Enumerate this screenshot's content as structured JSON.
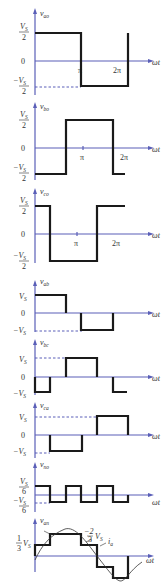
{
  "figure": {
    "axis_color": "#5a5fb8",
    "wave_color": "#1a1a1a",
    "x_label": "ωt",
    "x_ticks": [
      "π",
      "2π"
    ],
    "plots": [
      {
        "name": "v_ao",
        "label": "v",
        "sub": "ao",
        "y_ticks": {
          "top": "V_S/2",
          "zero": "0",
          "bottom": "−V_S/2"
        }
      },
      {
        "name": "v_bo",
        "label": "v",
        "sub": "bo",
        "y_ticks": {
          "top": "V_S/2",
          "zero": "0",
          "bottom": "−V_S/2"
        }
      },
      {
        "name": "v_co",
        "label": "v",
        "sub": "co",
        "y_ticks": {
          "top": "V_S/2",
          "zero": "0",
          "bottom": "−V_S/2"
        }
      },
      {
        "name": "v_ab",
        "label": "v",
        "sub": "ab",
        "y_ticks": {
          "top": "V_S",
          "zero": "0",
          "bottom": "−V_S"
        }
      },
      {
        "name": "v_bc",
        "label": "v",
        "sub": "bc",
        "y_ticks": {
          "top": "V_S",
          "zero": "0",
          "bottom": "−V_S"
        }
      },
      {
        "name": "v_ca",
        "label": "v",
        "sub": "ca",
        "y_ticks": {
          "top": "V_S",
          "zero": "0",
          "bottom": "−V_S"
        }
      },
      {
        "name": "v_no",
        "label": "v",
        "sub": "no",
        "y_ticks": {
          "top": "V_S/6",
          "bottom": "−V_S/6"
        }
      },
      {
        "name": "v_an",
        "label": "v",
        "sub": "an",
        "y_ticks": {
          "top": "1/3 V_S"
        },
        "annotations": [
          "2/3 V_S",
          "i_a"
        ]
      }
    ]
  },
  "text": {
    "v": "v",
    "zero": "0",
    "pi": "π",
    "two_pi": "2π",
    "wt": "ωt",
    "vs": "V",
    "s_sub": "S",
    "two": "2",
    "six": "6",
    "minus": "−",
    "one_third": "1",
    "three": "3",
    "two_third_num": "2",
    "ia": "i",
    "ia_sub": "a",
    "sub_ao": "ao",
    "sub_bo": "bo",
    "sub_co": "co",
    "sub_ab": "ab",
    "sub_bc": "bc",
    "sub_ca": "ca",
    "sub_no": "no",
    "sub_an": "an"
  }
}
